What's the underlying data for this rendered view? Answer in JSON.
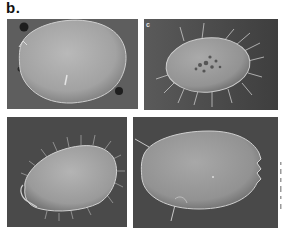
{
  "figure": {
    "panel_label": "b.",
    "micrographs": [
      {
        "position": "top-left",
        "sublabel": "",
        "subject": "smooth rounded carapace, no setae",
        "background": "#5e5e5e"
      },
      {
        "position": "top-right",
        "sublabel": "c",
        "subject": "oval carapace with spiny marginal setae and dark dorsal pits",
        "background": "#4e4e4e"
      },
      {
        "position": "bottom-left",
        "sublabel": "",
        "subject": "teardrop carapace fringed with fine setae",
        "background": "#4a4a4a"
      },
      {
        "position": "bottom-right",
        "sublabel": "",
        "subject": "elongate oval carapace with notched posterior margin and two long spines",
        "background": "#494949"
      }
    ]
  }
}
